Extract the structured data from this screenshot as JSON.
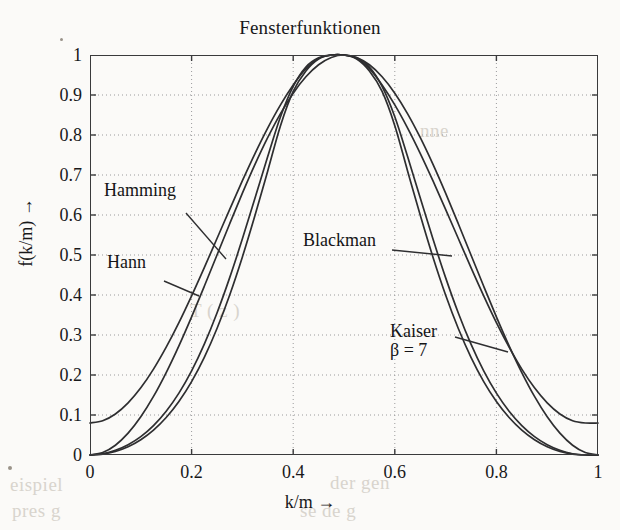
{
  "chart_data": {
    "type": "line",
    "title": "Fensterfunktionen",
    "xlabel": "k/m →",
    "ylabel": "f(k/m) →",
    "xlim": [
      0,
      1
    ],
    "ylim": [
      0,
      1
    ],
    "grid": true,
    "grid_style": "dotted",
    "legend": "inline-annotations",
    "xticks": [
      "0",
      "0.2",
      "0.4",
      "0.6",
      "0.8",
      "1"
    ],
    "xtick_values": [
      0,
      0.2,
      0.4,
      0.6,
      0.8,
      1
    ],
    "yticks": [
      "0",
      "0.1",
      "0.2",
      "0.3",
      "0.4",
      "0.5",
      "0.6",
      "0.7",
      "0.8",
      "0.9",
      "1"
    ],
    "ytick_values": [
      0,
      0.1,
      0.2,
      0.3,
      0.4,
      0.5,
      0.6,
      0.7,
      0.8,
      0.9,
      1
    ],
    "x": [
      0,
      0.025,
      0.05,
      0.075,
      0.1,
      0.125,
      0.15,
      0.175,
      0.2,
      0.225,
      0.25,
      0.275,
      0.3,
      0.325,
      0.35,
      0.375,
      0.4,
      0.425,
      0.45,
      0.475,
      0.5,
      0.525,
      0.55,
      0.575,
      0.6,
      0.625,
      0.65,
      0.675,
      0.7,
      0.725,
      0.75,
      0.775,
      0.8,
      0.825,
      0.85,
      0.875,
      0.9,
      0.925,
      0.95,
      0.975,
      1
    ],
    "series": [
      {
        "name": "Hamming",
        "values": [
          0.08,
          0.0857,
          0.1026,
          0.1303,
          0.1679,
          0.2147,
          0.2695,
          0.3309,
          0.3979,
          0.4685,
          0.5412,
          0.6142,
          0.6858,
          0.7543,
          0.818,
          0.8754,
          0.9251,
          0.9661,
          0.9915,
          1.0,
          1.0,
          0.9915,
          0.9661,
          0.9251,
          0.8754,
          0.818,
          0.7543,
          0.6858,
          0.6142,
          0.5412,
          0.4685,
          0.3979,
          0.3309,
          0.2695,
          0.2147,
          0.1679,
          0.1303,
          0.1026,
          0.0857,
          0.08,
          0.08
        ]
      },
      {
        "name": "Hann",
        "values": [
          0,
          0.0062,
          0.0245,
          0.0546,
          0.0955,
          0.1464,
          0.2061,
          0.273,
          0.3455,
          0.4218,
          0.5,
          0.5782,
          0.6545,
          0.727,
          0.7939,
          0.8536,
          0.9045,
          0.9455,
          0.9755,
          0.9938,
          1.0,
          0.9938,
          0.9755,
          0.9455,
          0.9045,
          0.8536,
          0.7939,
          0.727,
          0.6545,
          0.5782,
          0.5,
          0.4218,
          0.3455,
          0.273,
          0.2061,
          0.1464,
          0.0955,
          0.0546,
          0.0245,
          0.0062,
          0
        ]
      },
      {
        "name": "Blackman",
        "values": [
          0,
          0.0022,
          0.009,
          0.0208,
          0.0383,
          0.0623,
          0.0938,
          0.1338,
          0.1836,
          0.2442,
          0.3163,
          0.4001,
          0.4952,
          0.5998,
          0.7108,
          0.8233,
          0.9088,
          0.96,
          0.99,
          1.0,
          1.0,
          0.99,
          0.96,
          0.9088,
          0.8233,
          0.7108,
          0.5998,
          0.4952,
          0.4001,
          0.3163,
          0.2442,
          0.1836,
          0.1338,
          0.0938,
          0.0623,
          0.0383,
          0.0208,
          0.009,
          0.0022,
          0,
          0
        ]
      },
      {
        "name": "Kaiser",
        "beta": 7,
        "values": [
          0,
          0.0032,
          0.0118,
          0.0258,
          0.046,
          0.0735,
          0.1094,
          0.1547,
          0.2104,
          0.2772,
          0.3551,
          0.4434,
          0.5404,
          0.643,
          0.7468,
          0.8457,
          0.9216,
          0.97,
          0.993,
          1.0,
          1.0,
          0.993,
          0.97,
          0.9216,
          0.8457,
          0.7468,
          0.643,
          0.5404,
          0.4434,
          0.3551,
          0.2772,
          0.2104,
          0.1547,
          0.1094,
          0.0735,
          0.046,
          0.0258,
          0.0118,
          0.0032,
          0,
          0
        ]
      }
    ],
    "annotations": [
      {
        "text": "Hamming",
        "target_series": "Hamming"
      },
      {
        "text": "Hann",
        "target_series": "Hann"
      },
      {
        "text": "Blackman",
        "target_series": "Blackman"
      },
      {
        "text": "Kaiser",
        "sub": "β = 7",
        "target_series": "Kaiser"
      }
    ],
    "colors": {
      "curve": "#2e2e30",
      "axis": "#3a3a3c",
      "grid": "#9a9a9c",
      "text": "#18181a"
    }
  }
}
